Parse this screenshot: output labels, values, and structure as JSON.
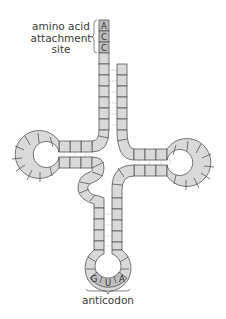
{
  "labels": {
    "amino_acid_line1": "amino acid",
    "amino_acid_line2": "attachment",
    "amino_acid_line3": "site",
    "anticodon": "anticodon"
  },
  "acceptor_end": {
    "bases": [
      "A",
      "C",
      "C"
    ]
  },
  "anticodon_loop": {
    "bases": [
      "G",
      "U",
      "A"
    ]
  },
  "colors": {
    "nucleotide_fill": "#d9d9d9",
    "highlight_fill": "#bdbdbd",
    "outline": "#555555",
    "pairing_line": "#9a9a9a"
  },
  "regions": [
    {
      "name": "acceptor-stem"
    },
    {
      "name": "d-arm"
    },
    {
      "name": "t-arm"
    },
    {
      "name": "anticodon-arm"
    },
    {
      "name": "variable-loop"
    }
  ]
}
